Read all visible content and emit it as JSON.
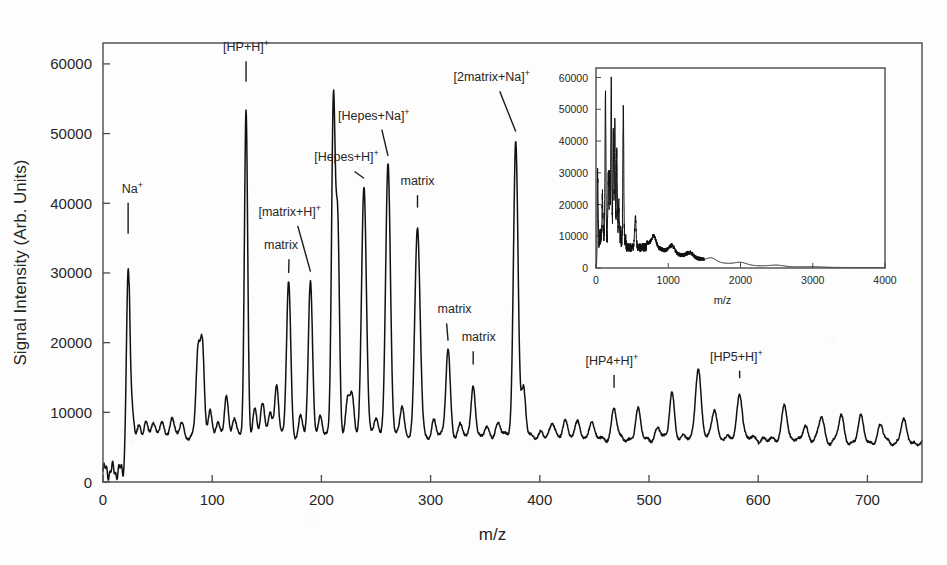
{
  "figure": {
    "background_color": "#fdfdfd",
    "trace_color": "#111111",
    "axis_color": "#4a4a4a"
  },
  "chart_data": {
    "type": "line",
    "title": "",
    "xlabel": "m/z",
    "ylabel": "Signal Intensity (Arb. Units)",
    "xlim": [
      0,
      750
    ],
    "ylim": [
      0,
      63000
    ],
    "xticks": [
      0,
      100,
      200,
      300,
      400,
      500,
      600,
      700
    ],
    "xtick_labels": [
      "0",
      "100",
      "200",
      "300",
      "400",
      "500",
      "600",
      "700"
    ],
    "yticks": [
      0,
      10000,
      20000,
      30000,
      40000,
      50000,
      60000
    ],
    "ytick_labels": [
      "0",
      "10000",
      "20000",
      "30000",
      "40000",
      "50000",
      "60000"
    ],
    "grid": false,
    "legend": null,
    "annotations": [
      {
        "text": "Na",
        "sup": "+",
        "mz": 23,
        "intensity": 30500,
        "label_x": 27,
        "label_y": 41500,
        "leader": true
      },
      {
        "text": "[HP+H]",
        "sup": "+",
        "mz": 131,
        "intensity": 53500,
        "label_x": 131,
        "label_y": 61800,
        "leader": true
      },
      {
        "text": "matrix",
        "sup": "",
        "mz": 170,
        "intensity": 28700,
        "label_x": 163,
        "label_y": 33400,
        "leader": true
      },
      {
        "text": "[matrix+H]",
        "sup": "+",
        "mz": 190,
        "intensity": 28900,
        "label_x": 171,
        "label_y": 38200,
        "leader": true
      },
      {
        "text": "[Hepes+H]",
        "sup": "+",
        "mz": 239,
        "intensity": 42300,
        "label_x": 223,
        "label_y": 46000,
        "leader": true
      },
      {
        "text": "[Hepes+Na]",
        "sup": "+",
        "mz": 261,
        "intensity": 45500,
        "label_x": 248,
        "label_y": 52000,
        "leader": true
      },
      {
        "text": "matrix",
        "sup": "",
        "mz": 288,
        "intensity": 36400,
        "label_x": 288,
        "label_y": 42600,
        "leader": true
      },
      {
        "text": "matrix",
        "sup": "",
        "mz": 316,
        "intensity": 19000,
        "label_x": 322,
        "label_y": 24200,
        "leader": true
      },
      {
        "text": "matrix",
        "sup": "",
        "mz": 339,
        "intensity": 13800,
        "label_x": 344,
        "label_y": 20200,
        "leader": true
      },
      {
        "text": "[2matrix+Na]",
        "sup": "+",
        "mz": 378,
        "intensity": 49000,
        "label_x": 356,
        "label_y": 57500,
        "leader": true
      },
      {
        "text": "[HP4+H]",
        "sup": "+",
        "mz": 468,
        "intensity": 10500,
        "label_x": 466,
        "label_y": 16800,
        "leader": true
      },
      {
        "text": "[HP5+H]",
        "sup": "+",
        "mz": 583,
        "intensity": 12500,
        "label_x": 580,
        "label_y": 17400,
        "leader": true
      }
    ],
    "baseline_level": 6500,
    "peaks": [
      {
        "mz": 23,
        "height": 30500,
        "width": 1.6
      },
      {
        "mz": 27,
        "height": 9800,
        "width": 1.4
      },
      {
        "mz": 33,
        "height": 8200,
        "width": 1.6
      },
      {
        "mz": 39,
        "height": 8800,
        "width": 1.6
      },
      {
        "mz": 46,
        "height": 8400,
        "width": 1.6
      },
      {
        "mz": 54,
        "height": 8600,
        "width": 1.8
      },
      {
        "mz": 63,
        "height": 9000,
        "width": 1.8
      },
      {
        "mz": 72,
        "height": 8500,
        "width": 1.8
      },
      {
        "mz": 87,
        "height": 18600,
        "width": 1.8
      },
      {
        "mz": 91,
        "height": 19600,
        "width": 1.8
      },
      {
        "mz": 98,
        "height": 10200,
        "width": 1.8
      },
      {
        "mz": 105,
        "height": 8600,
        "width": 1.8
      },
      {
        "mz": 113,
        "height": 12200,
        "width": 1.8
      },
      {
        "mz": 120,
        "height": 9000,
        "width": 1.8
      },
      {
        "mz": 131,
        "height": 53500,
        "width": 1.5
      },
      {
        "mz": 139,
        "height": 10600,
        "width": 1.8
      },
      {
        "mz": 146,
        "height": 11500,
        "width": 1.8
      },
      {
        "mz": 153,
        "height": 10000,
        "width": 1.8
      },
      {
        "mz": 159,
        "height": 13800,
        "width": 1.8
      },
      {
        "mz": 170,
        "height": 28700,
        "width": 1.9
      },
      {
        "mz": 181,
        "height": 9600,
        "width": 1.8
      },
      {
        "mz": 190,
        "height": 28900,
        "width": 1.9
      },
      {
        "mz": 199,
        "height": 9500,
        "width": 1.8
      },
      {
        "mz": 211,
        "height": 54600,
        "width": 1.7
      },
      {
        "mz": 215,
        "height": 36000,
        "width": 1.6
      },
      {
        "mz": 224,
        "height": 11800,
        "width": 1.8
      },
      {
        "mz": 228,
        "height": 12600,
        "width": 1.8
      },
      {
        "mz": 239,
        "height": 42300,
        "width": 2.2
      },
      {
        "mz": 250,
        "height": 9200,
        "width": 1.8
      },
      {
        "mz": 261,
        "height": 45500,
        "width": 2.2
      },
      {
        "mz": 274,
        "height": 10800,
        "width": 1.9
      },
      {
        "mz": 288,
        "height": 36400,
        "width": 2.4
      },
      {
        "mz": 303,
        "height": 9000,
        "width": 1.9
      },
      {
        "mz": 316,
        "height": 19000,
        "width": 2.0
      },
      {
        "mz": 327,
        "height": 8500,
        "width": 1.9
      },
      {
        "mz": 339,
        "height": 13800,
        "width": 1.9
      },
      {
        "mz": 352,
        "height": 8000,
        "width": 2.0
      },
      {
        "mz": 362,
        "height": 8600,
        "width": 2.0
      },
      {
        "mz": 378,
        "height": 49000,
        "width": 2.1
      },
      {
        "mz": 385,
        "height": 13800,
        "width": 2.0
      },
      {
        "mz": 401,
        "height": 7400,
        "width": 2.2
      },
      {
        "mz": 412,
        "height": 8400,
        "width": 2.2
      },
      {
        "mz": 423,
        "height": 9000,
        "width": 2.2
      },
      {
        "mz": 435,
        "height": 8600,
        "width": 2.2
      },
      {
        "mz": 447,
        "height": 8600,
        "width": 2.2
      },
      {
        "mz": 468,
        "height": 10500,
        "width": 2.2
      },
      {
        "mz": 490,
        "height": 10800,
        "width": 2.2
      },
      {
        "mz": 508,
        "height": 8000,
        "width": 2.2
      },
      {
        "mz": 521,
        "height": 13000,
        "width": 2.2
      },
      {
        "mz": 545,
        "height": 16200,
        "width": 2.6
      },
      {
        "mz": 560,
        "height": 10400,
        "width": 2.4
      },
      {
        "mz": 583,
        "height": 12500,
        "width": 2.4
      },
      {
        "mz": 605,
        "height": 6400,
        "width": 2.4
      },
      {
        "mz": 624,
        "height": 11000,
        "width": 2.4
      },
      {
        "mz": 643,
        "height": 8000,
        "width": 2.4
      },
      {
        "mz": 658,
        "height": 9400,
        "width": 2.4
      },
      {
        "mz": 676,
        "height": 9600,
        "width": 2.4
      },
      {
        "mz": 694,
        "height": 9800,
        "width": 2.4
      },
      {
        "mz": 712,
        "height": 8200,
        "width": 2.4
      },
      {
        "mz": 733,
        "height": 9000,
        "width": 2.4
      }
    ]
  },
  "inset_chart_data": {
    "type": "line",
    "title": "",
    "xlabel": "m/z",
    "ylabel": "",
    "xlim": [
      0,
      4000
    ],
    "ylim": [
      0,
      63000
    ],
    "xticks": [
      0,
      1000,
      2000,
      3000,
      4000
    ],
    "xtick_labels": [
      "0",
      "1000",
      "2000",
      "3000",
      "4000"
    ],
    "yticks": [
      0,
      10000,
      20000,
      30000,
      40000,
      50000,
      60000
    ],
    "ytick_labels": [
      "0",
      "10000",
      "20000",
      "30000",
      "40000",
      "50000",
      "60000"
    ],
    "grid": false,
    "peaks": [
      {
        "mz": 23,
        "height": 31000,
        "width": 6
      },
      {
        "mz": 90,
        "height": 19500,
        "width": 6
      },
      {
        "mz": 131,
        "height": 53500,
        "width": 6
      },
      {
        "mz": 170,
        "height": 28500,
        "width": 6
      },
      {
        "mz": 190,
        "height": 29000,
        "width": 6
      },
      {
        "mz": 211,
        "height": 54600,
        "width": 6
      },
      {
        "mz": 239,
        "height": 42000,
        "width": 6
      },
      {
        "mz": 261,
        "height": 45500,
        "width": 6
      },
      {
        "mz": 288,
        "height": 36000,
        "width": 6
      },
      {
        "mz": 316,
        "height": 19000,
        "width": 6
      },
      {
        "mz": 378,
        "height": 49000,
        "width": 6
      },
      {
        "mz": 545,
        "height": 16000,
        "width": 10
      },
      {
        "mz": 800,
        "height": 10000,
        "width": 30
      },
      {
        "mz": 1050,
        "height": 7600,
        "width": 40
      },
      {
        "mz": 1300,
        "height": 5200,
        "width": 50
      },
      {
        "mz": 1600,
        "height": 3200,
        "width": 60
      },
      {
        "mz": 2000,
        "height": 1800,
        "width": 80
      },
      {
        "mz": 2500,
        "height": 900,
        "width": 100
      },
      {
        "mz": 3000,
        "height": 400,
        "width": 120
      }
    ],
    "baseline_level": 6000
  }
}
